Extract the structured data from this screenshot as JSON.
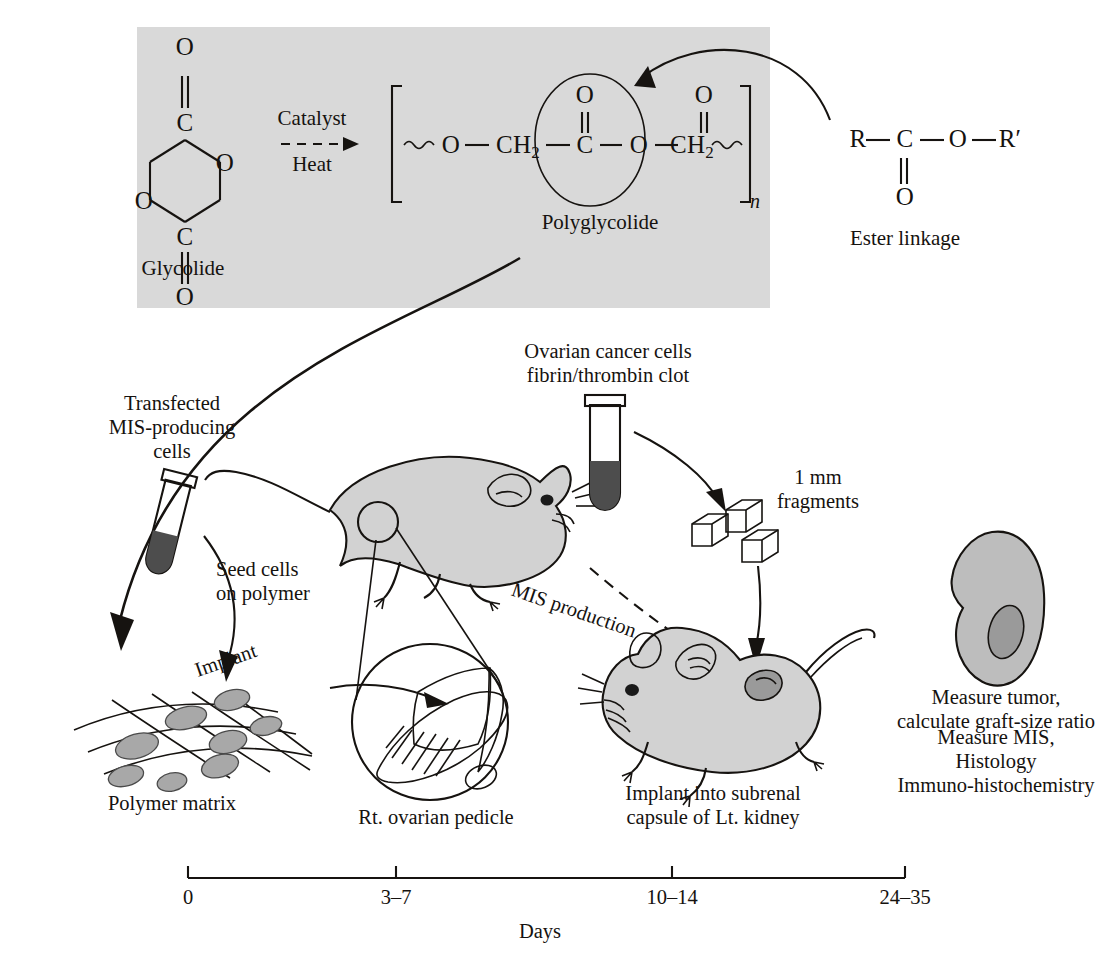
{
  "figure": {
    "title_absent": true,
    "type": "scientific-schematic"
  },
  "chemistry_panel": {
    "background_color": "#d9d9d9",
    "reactant_label": "Glycolide",
    "reactant_atoms": [
      "O",
      "C",
      "O",
      "O",
      "C",
      "O"
    ],
    "arrow_top_label": "Catalyst",
    "arrow_bottom_label": "Heat",
    "product_label": "Polyglycolide",
    "product_chain": [
      "O",
      "CH2",
      "C",
      "O",
      "CH2",
      "C"
    ],
    "repeat_subscript": "n",
    "highlight_shape": "ellipse-around-ester"
  },
  "ester": {
    "atoms": [
      "R",
      "C",
      "O",
      "R′"
    ],
    "carbonyl_oxygen": "O",
    "caption": "Ester linkage"
  },
  "steps": {
    "transfected_cells": "Transfected\nMIS-producing\ncells",
    "seed_cells": "Seed cells\non polymer",
    "polymer_matrix": "Polymer matrix",
    "implant": "Implant",
    "rt_ovarian_pedicle": "Rt. ovarian pedicle",
    "ovarian_cancer": "Ovarian cancer cells\nfibrin/thrombin clot",
    "fragments": "1 mm\nfragments",
    "mis_production": "MIS production",
    "implant_subrenal": "Implant into subrenal\ncapsule of Lt. kidney",
    "measure_tumor": "Measure tumor,\ncalculate graft-size ratio",
    "measure_mis": "Measure MIS,\nHistology\nImmuno-histochemistry"
  },
  "timeline": {
    "axis_label": "Days",
    "ticks": [
      "0",
      "3–7",
      "10–14",
      "24–35"
    ],
    "tick_x": [
      188,
      396,
      672,
      905
    ]
  },
  "colors": {
    "panel_bg": "#d9d9d9",
    "ink": "#15120f",
    "mouse_fill": "#d2d2d2",
    "organ_fill": "#bdbdbd",
    "organ_dark": "#9a9a9a",
    "tube_dark": "#4d4d4d",
    "cell_fill": "#a8a8a8"
  }
}
